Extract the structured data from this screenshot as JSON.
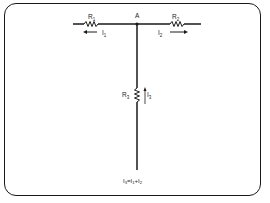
{
  "diagram": {
    "node_label": "A",
    "resistors": [
      {
        "id": "R1",
        "label": "R",
        "sub": "1"
      },
      {
        "id": "R2",
        "label": "R",
        "sub": "2"
      },
      {
        "id": "R3",
        "label": "R",
        "sub": "3"
      }
    ],
    "currents": [
      {
        "id": "I1",
        "label": "I",
        "sub": "1",
        "direction": "left"
      },
      {
        "id": "I2",
        "label": "I",
        "sub": "2",
        "direction": "right"
      },
      {
        "id": "I3",
        "label": "I",
        "sub": "3",
        "direction": "up"
      }
    ],
    "equation": {
      "parts": [
        "I",
        "3",
        "=I",
        "1",
        "+I",
        "2"
      ],
      "text": "I3=I1+I2"
    },
    "colors": {
      "wire": "#1a1a1a",
      "text": "#222222"
    }
  }
}
